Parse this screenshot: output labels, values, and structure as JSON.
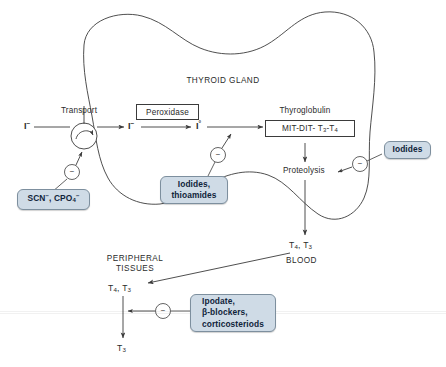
{
  "figure": {
    "type": "biological-pathway-diagram",
    "background_color": "#ffffff",
    "drug_box_fill": "#cfdbe6",
    "drug_box_border": "#7d8f9e",
    "line_color": "#3b3b3b"
  },
  "compartments": {
    "gland_label": "THYROID GLAND",
    "blood_label": "BLOOD",
    "peripheral_label_line1": "PERIPHERAL",
    "peripheral_label_line2": "TISSUES"
  },
  "pathway": {
    "transport_label": "Transport",
    "peroxidase_label": "Peroxidase",
    "thyroglobulin_label": "Thyroglobulin",
    "thyroglobulin_contents": "MIT-DIT- T3-T4",
    "proteolysis_label": "Proteolysis",
    "iodide_extracellular": "I-",
    "iodide_intracellular": "I-",
    "iodine_oxidized": "I°",
    "hormones_blood": "T4, T3",
    "hormones_peripheral": "T4, T3",
    "hormone_t3": "T3"
  },
  "drug_boxes": [
    {
      "id": "transport-inhibitors",
      "lines": [
        "SCN-, CPO4-"
      ],
      "target": "Transport (iodide trapping)"
    },
    {
      "id": "organification-inhibitors",
      "lines": [
        "Iodides,",
        "thioamides"
      ],
      "target": "Peroxidase / organification"
    },
    {
      "id": "proteolysis-inhibitors",
      "lines": [
        "Iodides"
      ],
      "target": "Proteolysis"
    },
    {
      "id": "peripheral-conversion-inhibitors",
      "lines": [
        "Ipodate,",
        "β-blockers,",
        "corticosteriods"
      ],
      "target": "Peripheral T4 to T3 conversion"
    }
  ],
  "inhibition_symbol": "−",
  "inhibition_nodes": [
    {
      "id": "inhibit-transport",
      "symbol": "−"
    },
    {
      "id": "inhibit-peroxidase",
      "symbol": "−"
    },
    {
      "id": "inhibit-proteolysis",
      "symbol": "−"
    },
    {
      "id": "inhibit-peripheral",
      "symbol": "−"
    }
  ]
}
